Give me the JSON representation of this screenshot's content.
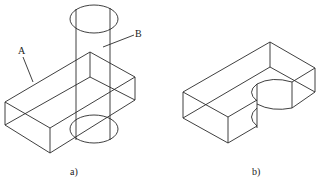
{
  "figure": {
    "panels": [
      {
        "caption": "a)",
        "description": "Rectangular block A intersected by vertical cylinder B",
        "labels": [
          {
            "text": "A",
            "target": "rectangular block"
          },
          {
            "text": "B",
            "target": "cylinder"
          }
        ]
      },
      {
        "caption": "b)",
        "description": "Resulting block with cylindrical notch removed"
      }
    ],
    "line_color": "#2a2a2a",
    "background": "#ffffff"
  }
}
